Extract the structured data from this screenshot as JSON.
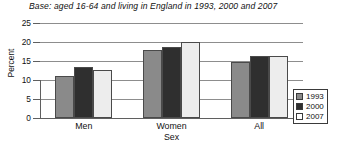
{
  "chart_data": {
    "type": "bar",
    "title": "Base: aged 16-64 and living in England in 1993, 2000 and 2007",
    "xlabel": "Sex",
    "ylabel": "Percent",
    "categories": [
      "Men",
      "Women",
      "All"
    ],
    "series": [
      {
        "name": "1993",
        "color": "#8a8a8a",
        "values": [
          11.0,
          18.0,
          14.7
        ]
      },
      {
        "name": "2000",
        "color": "#2f2f2f",
        "values": [
          13.5,
          18.7,
          16.3
        ]
      },
      {
        "name": "2007",
        "color": "#ededed",
        "values": [
          12.7,
          20.0,
          16.3
        ]
      }
    ],
    "ylim": [
      0,
      25
    ],
    "yticks": [
      0,
      5,
      10,
      15,
      20,
      25
    ],
    "ytick_labels": [
      "0",
      "5",
      "10",
      "15",
      "20",
      "25"
    ],
    "grid": true,
    "legend_position": "right"
  },
  "legend": {
    "entries": [
      {
        "label": "1993"
      },
      {
        "label": "2000"
      },
      {
        "label": "2007"
      }
    ]
  }
}
